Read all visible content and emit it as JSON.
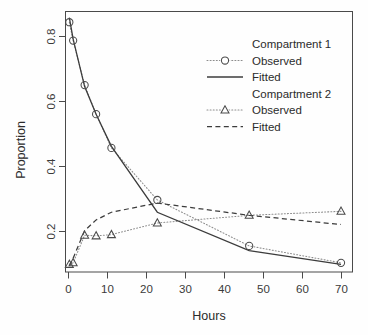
{
  "chart_data": {
    "type": "line",
    "title": "",
    "xlabel": "Hours",
    "ylabel": "Proportion",
    "xlim": [
      0,
      75
    ],
    "ylim": [
      0.03,
      0.88
    ],
    "xticks": [
      0,
      10,
      20,
      30,
      40,
      50,
      60,
      70
    ],
    "yticks": [
      0.2,
      0.4,
      0.6,
      0.8
    ],
    "xticklabels": [
      "0",
      "10",
      "20",
      "30",
      "40",
      "50",
      "60",
      "70"
    ],
    "yticklabels": [
      "0.2",
      "0.4",
      "0.6",
      "0.8"
    ],
    "grid": false,
    "legend_position": "top-right",
    "x": [
      1,
      2,
      5,
      8,
      12,
      24,
      48,
      72
    ],
    "series": [
      {
        "name": "Compartment 1 Observed",
        "marker": "circle",
        "linestyle": "dotted",
        "values": [
          0.845,
          0.785,
          0.64,
          0.545,
          0.435,
          0.265,
          0.115,
          0.06
        ]
      },
      {
        "name": "Compartment 1 Fitted",
        "marker": "none",
        "linestyle": "solid",
        "values": [
          0.86,
          0.79,
          0.635,
          0.545,
          0.44,
          0.225,
          0.1,
          0.055
        ]
      },
      {
        "name": "Compartment 2 Observed",
        "marker": "triangle",
        "linestyle": "dotted",
        "values": [
          0.055,
          0.06,
          0.15,
          0.148,
          0.152,
          0.19,
          0.215,
          0.228
        ]
      },
      {
        "name": "Compartment 2 Fitted",
        "marker": "none",
        "linestyle": "dashed",
        "values": [
          0.05,
          0.075,
          0.165,
          0.2,
          0.225,
          0.255,
          0.215,
          0.185
        ]
      }
    ]
  },
  "legend": {
    "groups": [
      {
        "heading": "Compartment 1",
        "entries": [
          {
            "label": "Observed",
            "symbol": "circle-dotted"
          },
          {
            "label": "Fitted",
            "symbol": "solid-line"
          }
        ]
      },
      {
        "heading": "Compartment 2",
        "entries": [
          {
            "label": "Observed",
            "symbol": "triangle-dotted"
          },
          {
            "label": "Fitted",
            "symbol": "dashed-line"
          }
        ]
      }
    ]
  }
}
